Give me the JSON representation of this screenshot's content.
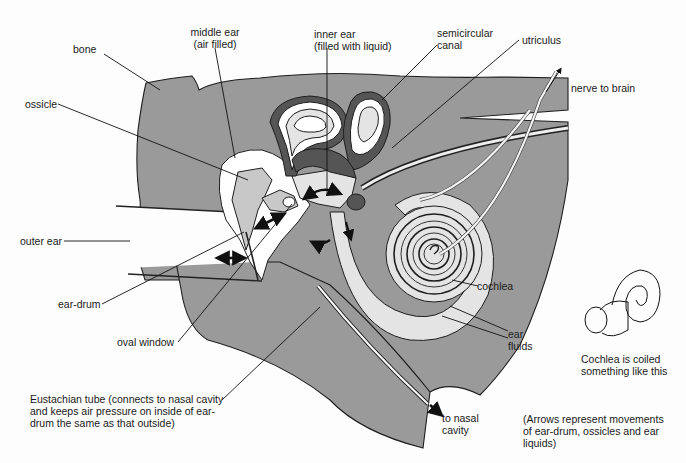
{
  "diagram": {
    "colors": {
      "bone": "#9a9a9a",
      "fluid": "#e4e4e4",
      "background": "#fdfdfd",
      "ink": "#1a1a1a"
    },
    "labels": {
      "bone": "bone",
      "middle_ear_line1": "middle ear",
      "middle_ear_line2": "(air filled)",
      "inner_ear_line1": "inner ear",
      "inner_ear_line2": "(filled with liquid)",
      "semicircular_line1": "semicircular",
      "semicircular_line2": "canal",
      "utriculus": "utriculus",
      "nerve_to_brain": "nerve to brain",
      "ossicle": "ossicle",
      "outer_ear": "outer ear",
      "ear_drum": "ear-drum",
      "oval_window": "oval window",
      "cochlea": "cochlea",
      "ear_fluids_line1": "ear",
      "ear_fluids_line2": "fluids",
      "eustachian_line1": "Eustachian tube (connects to nasal cavity",
      "eustachian_line2": "and keeps air pressure on inside of ear-",
      "eustachian_line3": "drum the same as that outside)",
      "to_nasal_line1": "to nasal",
      "to_nasal_line2": "cavity",
      "coil_caption_line1": "Cochlea is coiled",
      "coil_caption_line2": "something like this",
      "arrows_note_line1": "(Arrows represent movements",
      "arrows_note_line2": "of ear-drum, ossicles and ear",
      "arrows_note_line3": "liquids)"
    },
    "icons": {
      "movement_arrow": "double-headed-arrow",
      "coil_sketch": "snail-shell-spiral"
    }
  }
}
